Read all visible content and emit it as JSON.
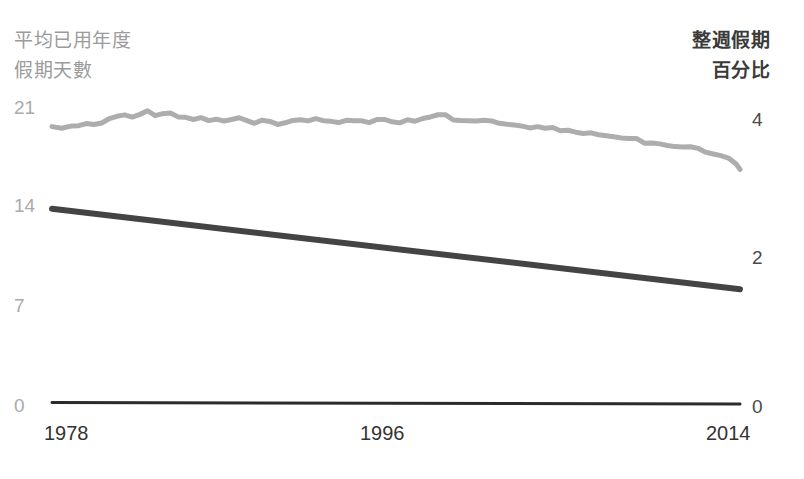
{
  "chart_data": {
    "type": "line",
    "title": "",
    "background": "#ffffff",
    "grid": false,
    "legend": "none",
    "x": {
      "label": "",
      "ticks": [
        "1978",
        "1996",
        "2014"
      ],
      "tick_values": [
        1978,
        1996,
        2014
      ],
      "range": [
        1978,
        2014
      ]
    },
    "axes": [
      {
        "side": "left",
        "title_lines": [
          "平均已用年度",
          "假期天數"
        ],
        "ticks": [
          "21",
          "14",
          "7",
          "0"
        ],
        "tick_values": [
          21,
          14,
          7,
          0
        ],
        "range": [
          0,
          21
        ],
        "color": "#aaaaaa"
      },
      {
        "side": "right",
        "title_lines": [
          "整週假期",
          "百分比"
        ],
        "ticks": [
          "4",
          "2",
          "0"
        ],
        "tick_values": [
          4,
          2,
          0
        ],
        "range": [
          0,
          4
        ],
        "color": "#4a4a4a"
      }
    ],
    "series": [
      {
        "name": "平均已用年度假期天數",
        "axis": "left",
        "color": "#adadad",
        "width": 5,
        "x": [
          1978,
          1978.5,
          1979,
          1979.4,
          1979.8,
          1980.2,
          1980.6,
          1981,
          1981.4,
          1981.8,
          1982.2,
          1982.6,
          1983,
          1983.4,
          1983.8,
          1984.2,
          1984.6,
          1985,
          1985.4,
          1985.8,
          1986.2,
          1986.6,
          1987,
          1987.4,
          1987.8,
          1988.2,
          1988.6,
          1989,
          1989.4,
          1989.8,
          1990.2,
          1990.6,
          1991,
          1991.4,
          1991.8,
          1992.2,
          1992.6,
          1993,
          1993.4,
          1993.8,
          1994.2,
          1994.6,
          1995,
          1995.4,
          1995.8,
          1996.2,
          1996.6,
          1997,
          1997.4,
          1997.8,
          1998.2,
          1998.6,
          1999,
          1999.4,
          1999.8,
          2000.2,
          2000.6,
          2001,
          2001.4,
          2001.8,
          2002.2,
          2002.6,
          2003,
          2003.4,
          2003.8,
          2004.2,
          2004.6,
          2005,
          2005.4,
          2005.8,
          2006.2,
          2006.6,
          2007,
          2007.4,
          2007.8,
          2008.2,
          2008.6,
          2009,
          2009.4,
          2009.8,
          2010.2,
          2010.6,
          2011,
          2011.4,
          2011.8,
          2012.2,
          2012.6,
          2013,
          2013.4,
          2013.8,
          2014
        ],
        "values": [
          19.3,
          19.4,
          19.35,
          19.5,
          19.6,
          19.55,
          19.7,
          19.9,
          20.1,
          20.25,
          20.2,
          20.35,
          20.45,
          20.3,
          20.4,
          20.35,
          20.2,
          20.05,
          19.95,
          20.0,
          19.9,
          19.95,
          19.85,
          19.9,
          19.95,
          19.8,
          19.65,
          19.75,
          19.7,
          19.55,
          19.8,
          19.9,
          19.85,
          19.8,
          19.9,
          19.85,
          19.9,
          19.8,
          19.85,
          19.9,
          19.85,
          19.8,
          19.9,
          19.85,
          19.8,
          19.75,
          19.85,
          19.8,
          19.9,
          20.0,
          20.2,
          20.15,
          19.95,
          19.85,
          19.8,
          19.9,
          19.85,
          19.75,
          19.6,
          19.5,
          19.45,
          19.35,
          19.4,
          19.3,
          19.2,
          19.25,
          19.15,
          19.1,
          19.0,
          18.9,
          18.95,
          18.85,
          18.7,
          18.6,
          18.55,
          18.6,
          18.5,
          18.3,
          18.2,
          18.1,
          18.15,
          18.0,
          17.9,
          17.95,
          17.8,
          17.6,
          17.5,
          17.35,
          17.2,
          16.9,
          16.5
        ]
      },
      {
        "name": "整週假期百分比",
        "axis": "right",
        "color": "#444444",
        "width": 6,
        "x": [
          1978,
          2014
        ],
        "values": [
          2.72,
          1.6
        ]
      }
    ],
    "baseline": {
      "name": "x-axis-baseline",
      "color": "#2b2b2b",
      "width": 3,
      "x": [
        1978,
        2014
      ],
      "values": [
        0.02,
        0.0
      ]
    }
  }
}
